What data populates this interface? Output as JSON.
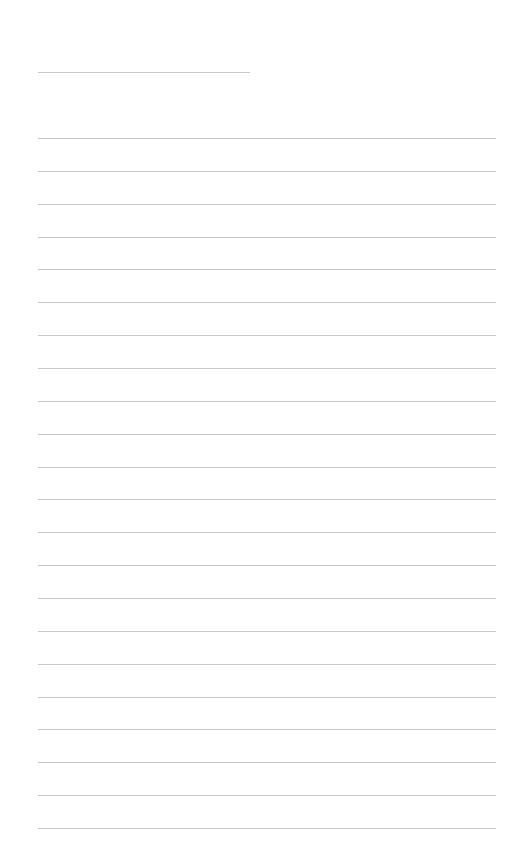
{
  "page": {
    "type": "lined-paper",
    "background": "#ffffff",
    "rule_color": "#c9c9c9",
    "title_rule": {
      "left": 38,
      "top": 72,
      "width": 212
    },
    "rules": {
      "count": 22,
      "first_top": 138,
      "spacing": 32.86,
      "left": 38,
      "right": 496
    }
  }
}
